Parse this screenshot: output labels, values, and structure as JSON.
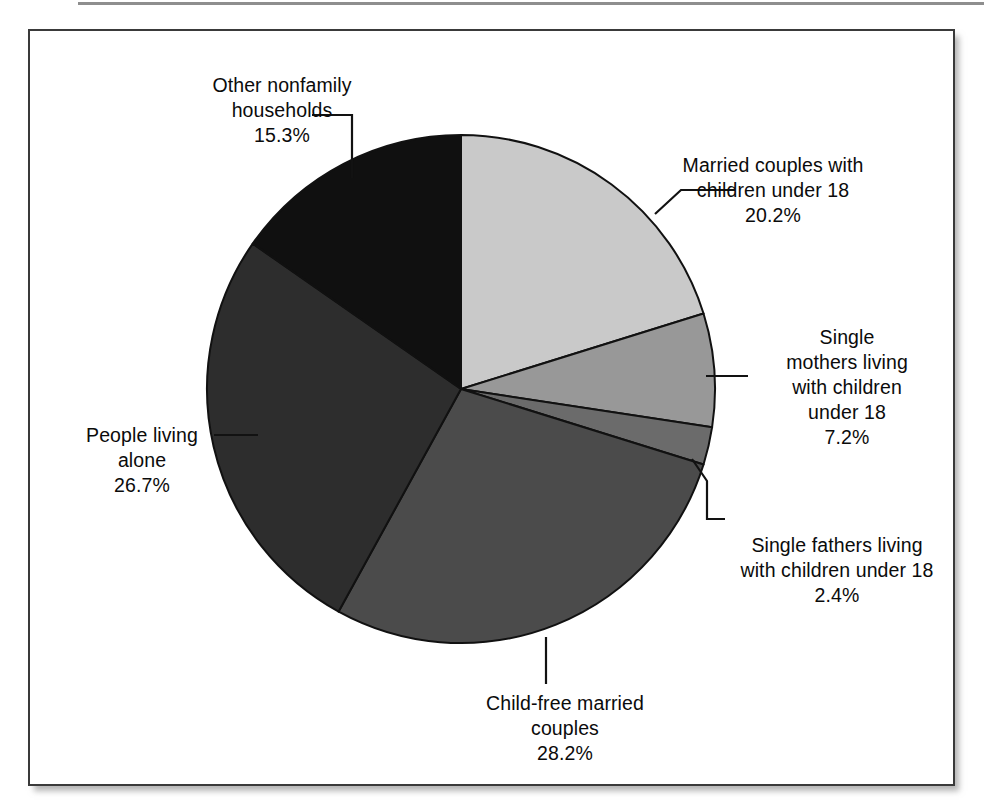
{
  "figure": {
    "background_color": "#ffffff",
    "frame_color": "#3a3a3a",
    "top_rule_color": "#8e8e8e"
  },
  "chart_data": {
    "type": "pie",
    "title": "",
    "subtitle": "",
    "xlabel": "",
    "ylabel": "",
    "legend_position": "callout-labels",
    "grid": false,
    "start_angle_deg": -90,
    "direction": "clockwise",
    "center": {
      "x": 461,
      "y": 389
    },
    "radius": 254,
    "units": "percent",
    "total": 100.0,
    "categories": [
      "Married couples with children under 18",
      "Single mothers living with children under 18",
      "Single fathers living with children under 18",
      "Child-free married couples",
      "People living alone",
      "Other nonfamily households"
    ],
    "values": [
      20.2,
      7.2,
      2.4,
      28.2,
      26.7,
      15.3
    ],
    "slice_colors": [
      "#c9c9c9",
      "#989898",
      "#6b6b6b",
      "#4b4b4b",
      "#2d2d2d",
      "#101010"
    ],
    "slice_edge_color": "#111111",
    "slices": [
      {
        "key": "married-with-children",
        "label": "Married couples with\nchildren under 18",
        "percent_text": "20.2%",
        "value": 20.2,
        "color": "#c9c9c9"
      },
      {
        "key": "single-mothers",
        "label": "Single\nmothers living\nwith children\nunder 18",
        "percent_text": "7.2%",
        "value": 7.2,
        "color": "#989898"
      },
      {
        "key": "single-fathers",
        "label": "Single fathers living\nwith children under 18",
        "percent_text": "2.4%",
        "value": 2.4,
        "color": "#6b6b6b"
      },
      {
        "key": "child-free-married",
        "label": "Child-free married\ncouples",
        "percent_text": "28.2%",
        "value": 28.2,
        "color": "#4b4b4b"
      },
      {
        "key": "people-living-alone",
        "label": "People living\nalone",
        "percent_text": "26.7%",
        "value": 26.7,
        "color": "#2d2d2d"
      },
      {
        "key": "other-nonfamily",
        "label": "Other nonfamily\nhouseholds",
        "percent_text": "15.3%",
        "value": 15.3,
        "color": "#101010"
      }
    ]
  }
}
